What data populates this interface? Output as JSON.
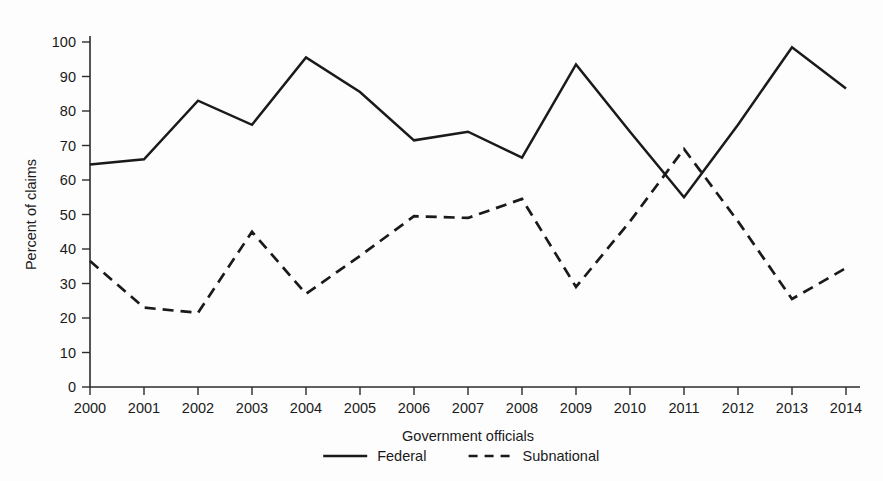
{
  "chart_data": {
    "type": "line",
    "title": "",
    "xlabel": "Government officials",
    "ylabel": "Percent of claims",
    "x": [
      2000,
      2001,
      2002,
      2003,
      2004,
      2005,
      2006,
      2007,
      2008,
      2009,
      2010,
      2011,
      2012,
      2013,
      2014
    ],
    "categories": [
      "2000",
      "2001",
      "2002",
      "2003",
      "2004",
      "2005",
      "2006",
      "2007",
      "2008",
      "2009",
      "2010",
      "2011",
      "2012",
      "2013",
      "2014"
    ],
    "xlim": [
      2000,
      2014
    ],
    "ylim": [
      0,
      100
    ],
    "yticks": [
      0,
      10,
      20,
      30,
      40,
      50,
      60,
      70,
      80,
      90,
      100
    ],
    "ytick_labels": [
      "0",
      "10",
      "20",
      "30",
      "40",
      "50",
      "60",
      "70",
      "80",
      "90",
      "100"
    ],
    "grid": false,
    "legend_position": "bottom-center",
    "series": [
      {
        "name": "Federal",
        "style": "solid",
        "color": "#1a1a1a",
        "values": [
          64.5,
          66,
          83,
          76,
          95.5,
          85.5,
          71.5,
          74,
          66.5,
          93.5,
          74,
          55,
          76,
          98.5,
          86.5
        ]
      },
      {
        "name": "Subnational",
        "style": "dashed",
        "color": "#1a1a1a",
        "values": [
          36.5,
          23,
          21.5,
          45,
          27,
          38,
          49.5,
          49,
          54.5,
          29,
          48,
          69,
          48,
          25.5,
          34.5
        ]
      }
    ]
  },
  "axes": {
    "y_title": "Percent of claims",
    "x_title": "Government officials"
  },
  "legend": {
    "items": [
      {
        "label": "Federal",
        "style": "solid"
      },
      {
        "label": "Subnational",
        "style": "dashed"
      }
    ]
  }
}
